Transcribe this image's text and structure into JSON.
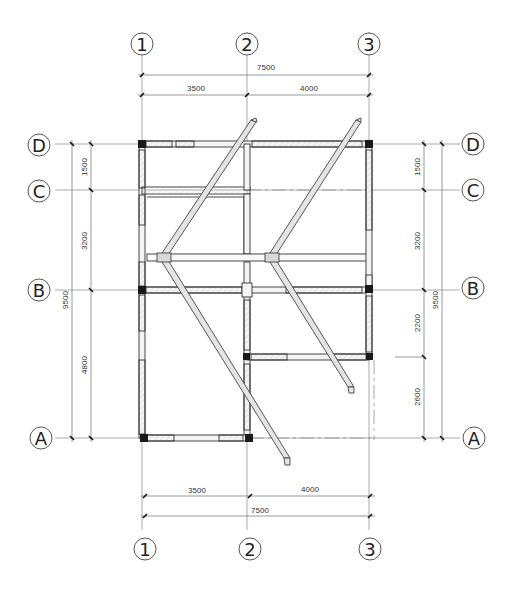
{
  "drawing": {
    "type": "structural floor plan",
    "axes": {
      "vertical": [
        {
          "label": "1",
          "x": 142
        },
        {
          "label": "2",
          "x": 247
        },
        {
          "label": "3",
          "x": 369
        }
      ],
      "horizontal": [
        {
          "label": "D",
          "y": 144
        },
        {
          "label": "C",
          "y": 190
        },
        {
          "label": "B",
          "y": 290
        },
        {
          "label": "A",
          "y": 438
        }
      ]
    },
    "dimensions": {
      "top": {
        "total": "7500",
        "segments": [
          "3500",
          "4000"
        ]
      },
      "bottom": {
        "total": "7500",
        "segments": [
          "3500",
          "4000"
        ]
      },
      "left": {
        "total": "9500",
        "segments": [
          "1500",
          "3200",
          "4800"
        ]
      },
      "right": {
        "total": "9500",
        "segments": [
          "1500",
          "3200",
          "2200",
          "2600"
        ]
      }
    },
    "colors": {
      "line": "#333333",
      "column": "#1a1a1a",
      "wall_fill": "#f2f2f2",
      "ramp_fill": "#e4e4e4",
      "grid": "#888888"
    }
  }
}
